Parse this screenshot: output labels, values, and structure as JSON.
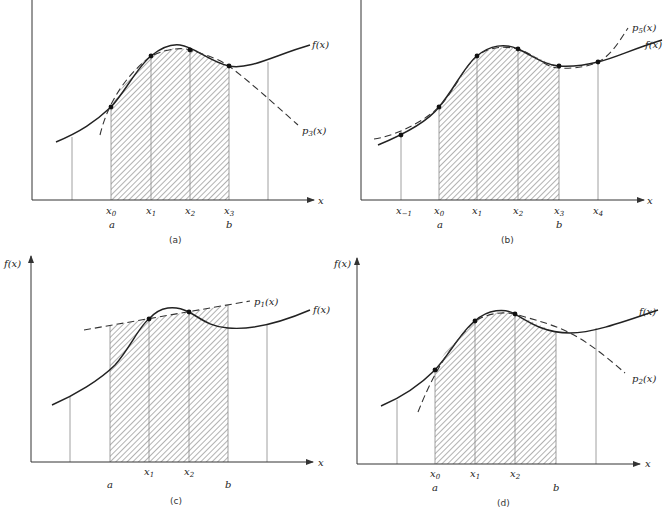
{
  "figure": {
    "panels": [
      {
        "id": "a",
        "caption": "(a)",
        "axis_x_label": "x",
        "axis_y_label": "",
        "curve_label": "f(x)",
        "approx_label": "p",
        "approx_sub": "3",
        "approx_arg": "(x)",
        "nodes": [
          {
            "base": "x",
            "sub": "0"
          },
          {
            "base": "x",
            "sub": "1"
          },
          {
            "base": "x",
            "sub": "2"
          },
          {
            "base": "x",
            "sub": "3"
          }
        ],
        "interval_start": "a",
        "interval_end": "b"
      },
      {
        "id": "b",
        "caption": "(b)",
        "axis_x_label": "x",
        "axis_y_label": "",
        "curve_label": "f(x)",
        "approx_label": "p",
        "approx_sub": "5",
        "approx_arg": "(x)",
        "nodes": [
          {
            "base": "x",
            "sub": "−1"
          },
          {
            "base": "x",
            "sub": "0"
          },
          {
            "base": "x",
            "sub": "1"
          },
          {
            "base": "x",
            "sub": "2"
          },
          {
            "base": "x",
            "sub": "3"
          },
          {
            "base": "x",
            "sub": "4"
          }
        ],
        "interval_start": "a",
        "interval_end": "b"
      },
      {
        "id": "c",
        "caption": "(c)",
        "axis_x_label": "x",
        "axis_y_label": "f(x)",
        "curve_label": "f(x)",
        "approx_label": "p",
        "approx_sub": "1",
        "approx_arg": "(x)",
        "nodes": [
          {
            "base": "x",
            "sub": "1"
          },
          {
            "base": "x",
            "sub": "2"
          }
        ],
        "interval_start": "a",
        "interval_end": "b"
      },
      {
        "id": "d",
        "caption": "(d)",
        "axis_x_label": "x",
        "axis_y_label": "f(x)",
        "curve_label": "f(x)",
        "approx_label": "p",
        "approx_sub": "2",
        "approx_arg": "(x)",
        "nodes": [
          {
            "base": "x",
            "sub": "0"
          },
          {
            "base": "x",
            "sub": "1"
          },
          {
            "base": "x",
            "sub": "2"
          }
        ],
        "interval_start": "a",
        "interval_end": "b"
      }
    ],
    "colors": {
      "ink": "#222222",
      "hatch": "#555555",
      "grid_line": "#888888",
      "background": "#ffffff"
    }
  }
}
